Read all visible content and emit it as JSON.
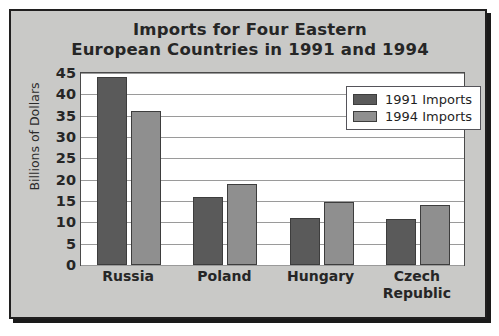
{
  "figure": {
    "background_color": "#c9c9c7",
    "plot_background_color": "#ffffff",
    "frame_border_color": "#201f1f"
  },
  "title": {
    "line1": "Imports for Four Eastern",
    "line2": "European Countries in 1991 and 1994"
  },
  "legend": {
    "position": "top-right",
    "entries": [
      {
        "label": "1991 Imports",
        "color": "#5a5a5a"
      },
      {
        "label": "1994 Imports",
        "color": "#8f8f8f"
      }
    ]
  },
  "axes": {
    "ylabel": "Billions of Dollars",
    "xlabel": "",
    "yticks": [
      45,
      40,
      35,
      30,
      25,
      20,
      15,
      10,
      5,
      0
    ],
    "ytick_labels": [
      "45",
      "40",
      "35",
      "30",
      "25",
      "20",
      "15",
      "10",
      "5",
      "0"
    ],
    "ylim": [
      0,
      45
    ],
    "grid": true
  },
  "categories_display": [
    {
      "line1": "Russia",
      "line2": ""
    },
    {
      "line1": "Poland",
      "line2": ""
    },
    {
      "line1": "Hungary",
      "line2": ""
    },
    {
      "line1": "Czech",
      "line2": "Republic"
    }
  ],
  "chart_data": {
    "type": "bar",
    "title": "Imports for Four Eastern European Countries in 1991 and 1994",
    "xlabel": "",
    "ylabel": "Billions of Dollars",
    "ylim": [
      0,
      45
    ],
    "yticks": [
      0,
      5,
      10,
      15,
      20,
      25,
      30,
      35,
      40,
      45
    ],
    "grid": true,
    "legend_position": "upper right",
    "categories": [
      "Russia",
      "Poland",
      "Hungary",
      "Czech Republic"
    ],
    "series": [
      {
        "name": "1991 Imports",
        "color": "#5a5a5a",
        "values": [
          44,
          16,
          11,
          10.8
        ]
      },
      {
        "name": "1994 Imports",
        "color": "#8f8f8f",
        "values": [
          36,
          19,
          14.8,
          14
        ]
      }
    ]
  }
}
